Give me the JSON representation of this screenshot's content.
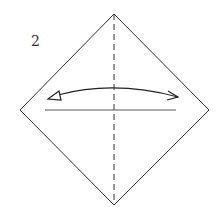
{
  "diagram": {
    "step_number": "2",
    "type": "origami-fold-instruction",
    "elements": [
      {
        "shape": "square-rotated-45",
        "description": "paper diamond"
      },
      {
        "shape": "dashed-vertical-line",
        "description": "valley fold crease"
      },
      {
        "shape": "horizontal-line",
        "description": "reference line"
      },
      {
        "shape": "curved-double-arrow",
        "description": "fold and unfold arrow"
      }
    ],
    "colors": {
      "stroke": "#333333",
      "background": "#ffffff"
    }
  }
}
